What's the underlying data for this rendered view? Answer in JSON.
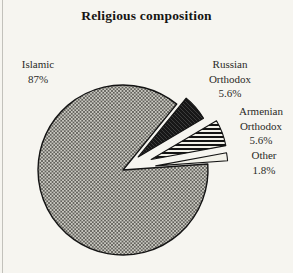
{
  "title": "Religious composition",
  "chart_data": {
    "type": "pie",
    "title": "Religious composition",
    "categories": [
      "Islamic",
      "Russian Orthodox",
      "Armenian Orthodox",
      "Other"
    ],
    "values": [
      87,
      5.6,
      5.6,
      1.8
    ],
    "unit": "%",
    "legend": "none",
    "slices": [
      {
        "label": "Islamic",
        "value": 87,
        "display": "Islamic\n87%",
        "pattern": "crosshatch"
      },
      {
        "label": "Russian Orthodox",
        "value": 5.6,
        "display": "Russian\nOrthodox\n5.6%",
        "pattern": "dark-diagonal"
      },
      {
        "label": "Armenian Orthodox",
        "value": 5.6,
        "display": "Armenian\nOrthodox\n5.6%",
        "pattern": "horizontal-stripes"
      },
      {
        "label": "Other",
        "value": 1.8,
        "display": "Other\n1.8%",
        "pattern": "solid-light"
      }
    ],
    "colors": {
      "background": "#f6f5f0",
      "outline": "#141414",
      "crosshatch_bg": "#cccbc4",
      "crosshatch_line": "#45453f",
      "dark_bg": "#171717",
      "dark_line": "#3c3c3c",
      "stripe_dark": "#141414",
      "stripe_light": "#f2f1e9",
      "solid_light": "#f3f2ea",
      "text": "#2b2a27",
      "left_rule": "#c2c1bb"
    }
  }
}
